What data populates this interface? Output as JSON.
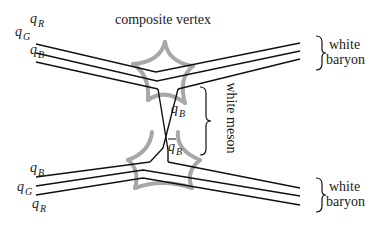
{
  "title": "composite vertex",
  "upper_baryon": {
    "quarks": [
      {
        "name": "q",
        "sub": "R"
      },
      {
        "name": "q",
        "sub": "G"
      },
      {
        "name": "q",
        "sub": "B"
      }
    ],
    "label_line1": "white",
    "label_line2": "baryon"
  },
  "lower_baryon": {
    "quarks": [
      {
        "name": "q",
        "sub": "B"
      },
      {
        "name": "q",
        "sub": "G"
      },
      {
        "name": "q",
        "sub": "R"
      }
    ],
    "label_line1": "white",
    "label_line2": "baryon"
  },
  "meson": {
    "quark": {
      "name": "q",
      "sub": "B"
    },
    "antiquark": {
      "name": "q",
      "sub": "B",
      "bar": true
    },
    "label": "white meson"
  },
  "colors": {
    "line": "#111111",
    "vertex_gray": "#a8a8a8",
    "text": "#1a1a1a"
  }
}
